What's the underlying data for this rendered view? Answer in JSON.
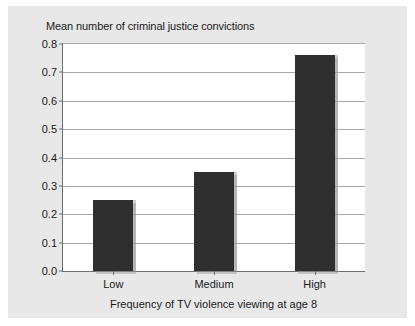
{
  "chart_data": {
    "type": "bar",
    "title": "Mean number of criminal justice convictions",
    "xlabel": "Frequency of TV violence viewing at age 8",
    "ylabel": "",
    "categories": [
      "Low",
      "Medium",
      "High"
    ],
    "values": [
      0.25,
      0.35,
      0.76
    ],
    "ylim": [
      0.0,
      0.8
    ],
    "ytick_step": 0.1,
    "ytick_labels": [
      "0.0",
      "0.1",
      "0.2",
      "0.3",
      "0.4",
      "0.5",
      "0.6",
      "0.7",
      "0.8"
    ],
    "ytick_values": [
      0.0,
      0.1,
      0.2,
      0.3,
      0.4,
      0.5,
      0.6,
      0.7,
      0.8
    ],
    "grid": true,
    "legend": false,
    "series": [
      {
        "name": "Mean number of criminal justice convictions",
        "values": [
          0.25,
          0.35,
          0.76
        ]
      }
    ],
    "colors": {
      "bar": "#2f2f2f",
      "figure_background": "#e8e8e8",
      "plot_background": "#ffffff",
      "gridline": "#a8a8a8",
      "axis": "#6e6e6e",
      "text": "#1a1a1a"
    }
  }
}
